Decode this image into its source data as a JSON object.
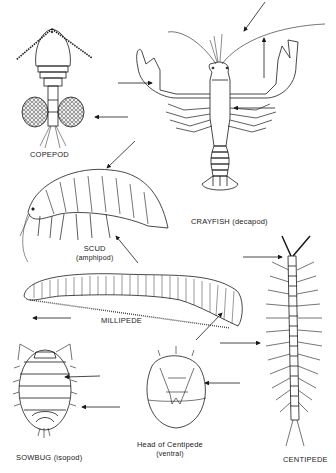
{
  "diagram": {
    "background": "#ffffff",
    "stroke_color": "#1a1a1a",
    "specimens": [
      {
        "id": "copepod",
        "label": "COPEPOD",
        "sublabel": ""
      },
      {
        "id": "crayfish",
        "label": "CRAYFISH (decapod)",
        "sublabel": ""
      },
      {
        "id": "scud",
        "label": "SCUD",
        "sublabel": "(amphipod)"
      },
      {
        "id": "millipede",
        "label": "MILLIPEDE",
        "sublabel": ""
      },
      {
        "id": "centipede",
        "label": "CENTIPEDE",
        "sublabel": ""
      },
      {
        "id": "sowbug",
        "label": "SOWBUG (isopod)",
        "sublabel": ""
      },
      {
        "id": "centipede-head",
        "label": "Head of Centipede",
        "sublabel": "(ventral)"
      }
    ],
    "pointer_arrow_count": 14
  }
}
